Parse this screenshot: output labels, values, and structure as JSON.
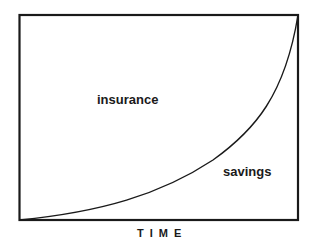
{
  "diagram": {
    "regions": {
      "upper_left_label": "insurance",
      "lower_right_label": "savings"
    },
    "x_axis_label": "TIME",
    "curve": {
      "description": "exponentially increasing curve from bottom-left to top-right corner dividing the box",
      "color": "#1a1a1a"
    },
    "frame_color": "#1a1a1a"
  }
}
